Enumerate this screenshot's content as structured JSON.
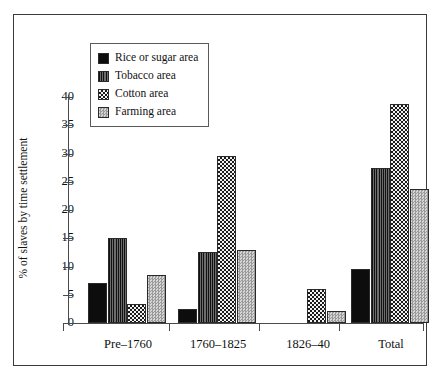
{
  "chart_data": {
    "type": "bar",
    "title": "",
    "xlabel": "",
    "ylabel": "% of slaves by time settlement",
    "ylim": [
      0,
      40
    ],
    "yticks": [
      0,
      5,
      10,
      15,
      20,
      25,
      30,
      35,
      40
    ],
    "ytick_labels": [
      "0",
      "5",
      "10",
      "15",
      "20",
      "25",
      "30",
      "35",
      "40"
    ],
    "grid": false,
    "legend_position": "upper-left-inside",
    "categories": [
      "Pre–1760",
      "1760–1825",
      "1826–40",
      "Total"
    ],
    "series": [
      {
        "name": "Rice or sugar area",
        "pattern": "solid-black",
        "color": "#0d0d0d",
        "values": [
          7.0,
          2.5,
          0,
          9.5
        ]
      },
      {
        "name": "Tobacco area",
        "pattern": "vertical-dark",
        "color": "#3f3f3f",
        "values": [
          15.0,
          12.5,
          0,
          27.5
        ]
      },
      {
        "name": "Cotton area",
        "pattern": "checker",
        "color": "#1a1a1a",
        "values": [
          3.3,
          29.5,
          6.0,
          38.7
        ]
      },
      {
        "name": "Farming area",
        "pattern": "light-dots",
        "color": "#bdbdbd",
        "values": [
          8.5,
          13.0,
          2.2,
          23.8
        ]
      }
    ]
  },
  "legend": {
    "items": [
      {
        "label": "Rice or sugar area",
        "pattern": "solid-black"
      },
      {
        "label": "Tobacco area",
        "pattern": "vertical-dark"
      },
      {
        "label": "Cotton area",
        "pattern": "checker"
      },
      {
        "label": "Farming area",
        "pattern": "light-dots"
      }
    ]
  }
}
